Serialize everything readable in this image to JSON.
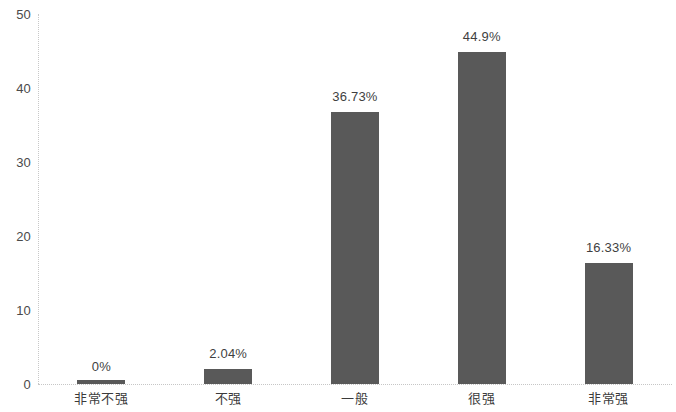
{
  "chart_data": {
    "type": "bar",
    "title": "",
    "subtitle": "",
    "xlabel": "",
    "ylabel": "",
    "categories": [
      "非常不强",
      "不强",
      "一般",
      "很强",
      "非常强"
    ],
    "values": [
      0,
      2.04,
      36.73,
      44.9,
      16.33
    ],
    "data_labels": [
      "0%",
      "2.04%",
      "36.73%",
      "44.9%",
      "16.33%"
    ],
    "series": [
      {
        "name": "",
        "values": [
          0,
          2.04,
          36.73,
          44.9,
          16.33
        ]
      }
    ],
    "ylim": [
      0,
      50
    ],
    "yticks": [
      0,
      10,
      20,
      30,
      40,
      50
    ],
    "ytick_labels": [
      "0",
      "10",
      "20",
      "30",
      "40",
      "50"
    ],
    "grid": false,
    "legend": null,
    "bar_color": "#595959",
    "axis_color": "#c8c8c8",
    "text_color": "#3f3f3f"
  }
}
